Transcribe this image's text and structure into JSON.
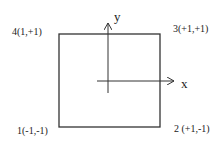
{
  "diagram": {
    "axes": {
      "x_label": "x",
      "y_label": "y"
    },
    "corners": [
      {
        "id": 1,
        "label": "1(-1,-1)"
      },
      {
        "id": 2,
        "label": "2 (+1,-1)"
      },
      {
        "id": 3,
        "label": "3(+1,+1)"
      },
      {
        "id": 4,
        "label": "4(1,+1)"
      }
    ],
    "colors": {
      "stroke": "#333333",
      "text": "#222222",
      "background": "#ffffff"
    }
  }
}
